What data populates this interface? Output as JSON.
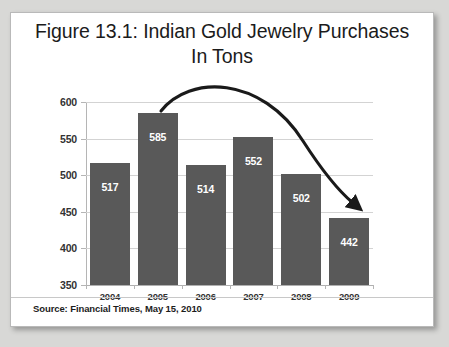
{
  "figure": {
    "title_line1": "Figure 13.1: Indian Gold Jewelry Purchases",
    "title_line2": "In Tons",
    "source": "Source: Financial Times, May 15, 2010"
  },
  "annotation": {
    "name": "downward-trend-arrow",
    "description": "Curved arrow rising over the 2005 peak then falling toward 2009",
    "color": "#1a1a1a"
  },
  "colors": {
    "bar_fill": "#595959",
    "bar_label": "#ffffff",
    "gridline": "#d3d3d3",
    "axis": "#b5b5b5",
    "card_background": "#ffffff",
    "page_background": "#d8d8d6",
    "text": "#1b1b1b"
  },
  "chart_data": {
    "type": "bar",
    "title": "Figure 13.1: Indian Gold Jewelry Purchases In Tons",
    "xlabel": "",
    "ylabel": "",
    "categories": [
      "2004",
      "2005",
      "2006",
      "2007",
      "2008",
      "2009"
    ],
    "values": [
      517,
      585,
      514,
      552,
      502,
      442
    ],
    "data_labels": [
      "517",
      "585",
      "514",
      "552",
      "502",
      "442"
    ],
    "ylim": [
      350,
      600
    ],
    "yticks": [
      350,
      400,
      450,
      500,
      550,
      600
    ],
    "ytick_labels": [
      "350",
      "400",
      "450",
      "500",
      "550",
      "600"
    ],
    "grid": true,
    "legend": false,
    "units": "Tons",
    "annotations": [
      "Curved downward-trend arrow from 2005 peak to 2009"
    ]
  }
}
